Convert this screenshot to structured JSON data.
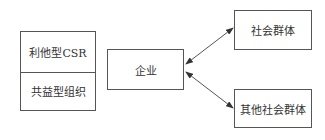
{
  "diagram": {
    "left_box": {
      "top_label": "利他型CSR",
      "bottom_label": "共益型组织"
    },
    "center_box": {
      "label": "企业"
    },
    "right_top_box": {
      "label": "社会群体"
    },
    "right_bottom_box": {
      "label": "其他社会群体"
    },
    "edges": [
      {
        "from": "企业",
        "to": "社会群体",
        "type": "bidirectional-arrow"
      },
      {
        "from": "企业",
        "to": "其他社会群体",
        "type": "bidirectional-arrow"
      }
    ],
    "colors": {
      "stroke": "#555555",
      "text": "#333333",
      "background": "#ffffff"
    }
  }
}
